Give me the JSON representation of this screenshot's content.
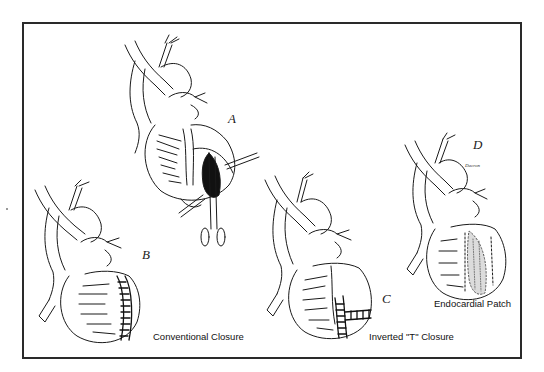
{
  "figure": {
    "panels": [
      {
        "id": "A",
        "letter": "A",
        "caption": ""
      },
      {
        "id": "B",
        "letter": "B",
        "caption": "Conventional Closure"
      },
      {
        "id": "C",
        "letter": "C",
        "caption": "Inverted \"T\" Closure"
      },
      {
        "id": "D",
        "letter": "D",
        "caption": "Endocardial Patch",
        "annotation": "Dacron"
      }
    ]
  },
  "colors": {
    "line": "#1a1a1a",
    "frame": "#2a2a2a",
    "background": "#ffffff",
    "shade": "#d9d9d9"
  }
}
